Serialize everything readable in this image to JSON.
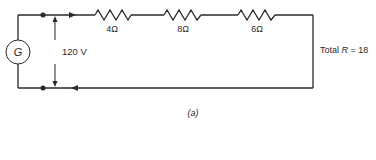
{
  "diagram": {
    "type": "series-circuit",
    "source": {
      "symbol": "G",
      "voltage_label": "120 V"
    },
    "resistors": [
      {
        "label": "4Ω",
        "value_ohms": 4
      },
      {
        "label": "8Ω",
        "value_ohms": 8
      },
      {
        "label": "6Ω",
        "value_ohms": 6
      }
    ],
    "total": {
      "prefix": "Total ",
      "symbol": "R",
      "suffix": " = 18"
    },
    "caption": "(a)",
    "colors": {
      "line": "#2a2a2a",
      "background": "#ffffff"
    }
  }
}
